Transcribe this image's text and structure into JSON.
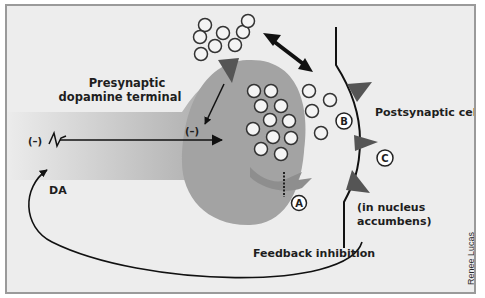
{
  "labels": {
    "presynaptic_line1": "Presynaptic",
    "presynaptic_line2": "dopamine terminal",
    "minus_left": "(–)",
    "minus_inner": "(–)",
    "da": "DA",
    "postsynaptic": "Postsynaptic cell",
    "nucleus_line1": "(in nucleus",
    "nucleus_line2": "accumbens)",
    "feedback": "Feedback inhibition",
    "site_a": "A",
    "site_b": "B",
    "site_c": "C",
    "credit": "Renee Lucas"
  },
  "colors": {
    "background": "#ededed",
    "terminal": "#a3a3a3",
    "receptor": "#555555",
    "line": "#111111",
    "vesicle_fill": "#f4f4f4",
    "vesicle_stroke": "#333333"
  }
}
